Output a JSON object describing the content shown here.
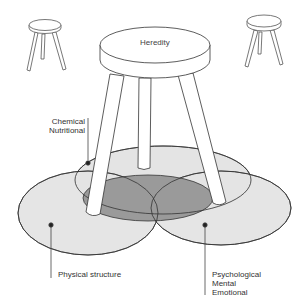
{
  "diagram": {
    "seat_label": "Heredity",
    "legs": [
      {
        "id": "chemical",
        "lines": [
          "Chemical",
          "Nutritional"
        ]
      },
      {
        "id": "physical",
        "lines": [
          "Physical structure"
        ]
      },
      {
        "id": "psychological",
        "lines": [
          "Psychological",
          "Mental",
          "Emotional"
        ]
      }
    ],
    "colors": {
      "ellipse_fill": "#e4e4e4",
      "overlap_fill": "#9a9a9a",
      "stroke": "#333333",
      "background": "#ffffff"
    }
  }
}
